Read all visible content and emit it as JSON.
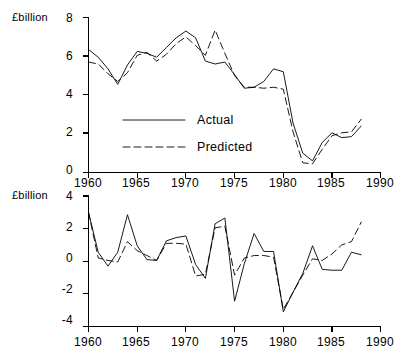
{
  "figure": {
    "background": "#ffffff",
    "line_color": "#000000"
  },
  "legend": {
    "actual_label": "Actual",
    "predicted_label": "Predicted"
  },
  "panels": {
    "top": {
      "unit_label": "£billion",
      "y_ticks": [
        "0",
        "2",
        "4",
        "6",
        "8"
      ],
      "x_ticks": [
        "1960",
        "1965",
        "1970",
        "1975",
        "1980",
        "1985",
        "1990"
      ]
    },
    "bottom": {
      "unit_label": "£billion",
      "y_ticks": [
        "-4",
        "-2",
        "0",
        "2",
        "4"
      ],
      "x_ticks_top": [
        "1960",
        "1965",
        "1970",
        "1975",
        "1980",
        "1985",
        "1990"
      ],
      "x_ticks_bottom": [
        "1960",
        "1965",
        "1970",
        "1975",
        "1980",
        "1985",
        "1990"
      ]
    }
  },
  "chart_data": [
    {
      "id": "levels",
      "type": "line",
      "title": "",
      "xlabel": "",
      "ylabel": "£billion",
      "xlim": [
        1960,
        1990
      ],
      "ylim": [
        0,
        8
      ],
      "xticks": [
        1960,
        1965,
        1970,
        1975,
        1980,
        1985,
        1990
      ],
      "yticks": [
        0,
        2,
        4,
        6,
        8
      ],
      "grid": false,
      "legend_position": "inside-lower-left",
      "x": [
        1960,
        1961,
        1962,
        1963,
        1964,
        1965,
        1966,
        1967,
        1968,
        1969,
        1970,
        1971,
        1972,
        1973,
        1974,
        1975,
        1976,
        1977,
        1978,
        1979,
        1980,
        1981,
        1982,
        1983,
        1984,
        1985,
        1986,
        1987,
        1988
      ],
      "series": [
        {
          "name": "Actual",
          "style": "solid",
          "values": [
            6.35,
            5.95,
            5.35,
            4.55,
            5.55,
            6.25,
            6.15,
            5.95,
            6.45,
            6.95,
            7.3,
            6.95,
            5.75,
            5.6,
            5.7,
            5.05,
            4.35,
            4.4,
            4.7,
            5.35,
            5.2,
            2.55,
            1.0,
            0.6,
            1.55,
            2.05,
            1.8,
            1.85,
            2.4
          ]
        },
        {
          "name": "Predicted",
          "style": "dashed",
          "values": [
            5.7,
            5.6,
            5.1,
            4.7,
            5.15,
            6.05,
            6.2,
            5.75,
            6.1,
            6.65,
            7.0,
            6.55,
            6.05,
            7.35,
            6.15,
            5.0,
            4.4,
            4.4,
            4.35,
            4.4,
            4.3,
            2.1,
            0.5,
            0.45,
            1.2,
            1.9,
            2.05,
            2.1,
            2.75
          ]
        }
      ]
    },
    {
      "id": "changes",
      "type": "line",
      "title": "",
      "xlabel": "",
      "ylabel": "£billion",
      "xlim": [
        1960,
        1990
      ],
      "ylim": [
        -4,
        4
      ],
      "xticks": [
        1960,
        1965,
        1970,
        1975,
        1980,
        1985,
        1990
      ],
      "yticks": [
        -4,
        -2,
        0,
        2,
        4
      ],
      "grid": false,
      "legend_position": "none",
      "x": [
        1960,
        1961,
        1962,
        1963,
        1964,
        1965,
        1966,
        1967,
        1968,
        1969,
        1970,
        1971,
        1972,
        1973,
        1974,
        1975,
        1976,
        1977,
        1978,
        1979,
        1980,
        1981,
        1982,
        1983,
        1984,
        1985,
        1986,
        1987,
        1988
      ],
      "series": [
        {
          "name": "Actual",
          "style": "solid",
          "values": [
            3.0,
            0.55,
            -0.3,
            0.55,
            2.85,
            0.95,
            0.1,
            0.05,
            1.25,
            1.45,
            1.55,
            -0.2,
            -1.05,
            2.3,
            2.65,
            -2.45,
            -0.15,
            1.7,
            0.6,
            0.6,
            -3.1,
            -1.9,
            -0.75,
            0.95,
            -0.5,
            -0.55,
            -0.55,
            0.55,
            0.4
          ]
        },
        {
          "name": "Predicted",
          "style": "dashed",
          "values": [
            3.0,
            0.2,
            0.05,
            -0.05,
            1.2,
            0.65,
            0.35,
            0.05,
            1.1,
            1.1,
            1.05,
            -0.9,
            -0.8,
            2.05,
            2.15,
            -0.85,
            0.2,
            0.35,
            0.35,
            0.25,
            -2.95,
            -1.9,
            -0.85,
            0.15,
            0.05,
            0.45,
            1.0,
            1.2,
            2.4
          ]
        }
      ]
    }
  ]
}
